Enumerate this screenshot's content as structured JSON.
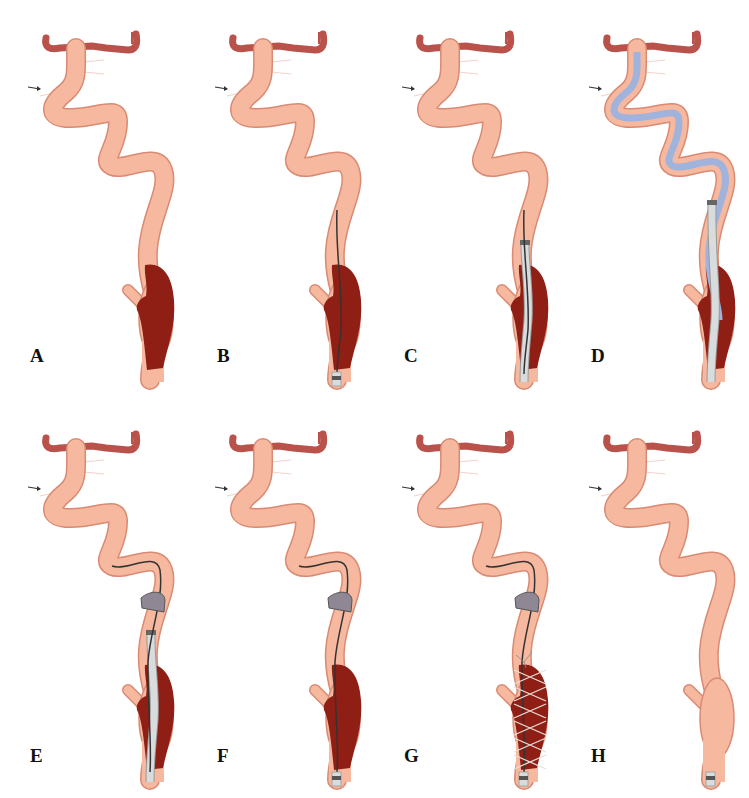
{
  "figure": {
    "panels": [
      {
        "id": "A",
        "label": "A",
        "clot": true,
        "guidewire": "none",
        "catheter": "tip_bottom_none",
        "microcatheter": false,
        "balloon": false,
        "stent": false,
        "sheath_bottom": false
      },
      {
        "id": "B",
        "label": "B",
        "clot": true,
        "guidewire": "through_clot",
        "catheter": "none",
        "microcatheter": false,
        "balloon": false,
        "stent": false,
        "sheath_bottom": true
      },
      {
        "id": "C",
        "label": "C",
        "clot": true,
        "guidewire": "through_clot",
        "catheter": "large_through_clot",
        "microcatheter": false,
        "balloon": false,
        "stent": false,
        "sheath_bottom": false
      },
      {
        "id": "D",
        "label": "D",
        "clot": true,
        "guidewire": "none",
        "catheter": "large_through_clot",
        "microcatheter": true,
        "balloon": false,
        "stent": false,
        "sheath_bottom": false
      },
      {
        "id": "E",
        "label": "E",
        "clot": true,
        "guidewire": "distal",
        "catheter": "large_through_clot",
        "microcatheter": false,
        "balloon": true,
        "stent": false,
        "sheath_bottom": false
      },
      {
        "id": "F",
        "label": "F",
        "clot": true,
        "guidewire": "distal",
        "catheter": "none",
        "microcatheter": false,
        "balloon": true,
        "stent": false,
        "sheath_bottom": true
      },
      {
        "id": "G",
        "label": "G",
        "clot": true,
        "guidewire": "distal",
        "catheter": "none",
        "microcatheter": false,
        "balloon": true,
        "stent": true,
        "sheath_bottom": true
      },
      {
        "id": "H",
        "label": "H",
        "clot": false,
        "guidewire": "none",
        "catheter": "none",
        "microcatheter": false,
        "balloon": false,
        "stent": false,
        "sheath_bottom": true
      }
    ],
    "colors": {
      "vessel_fill": "#f6b9a0",
      "vessel_edge": "#d98a72",
      "vessel_top": "#b8524a",
      "clot": "#8f1e14",
      "catheter": "#d8dcdc",
      "microcatheter": "#9fb3dd",
      "balloon": "#8f8794",
      "wire": "#333333",
      "stent": "#e8e0d8"
    }
  }
}
